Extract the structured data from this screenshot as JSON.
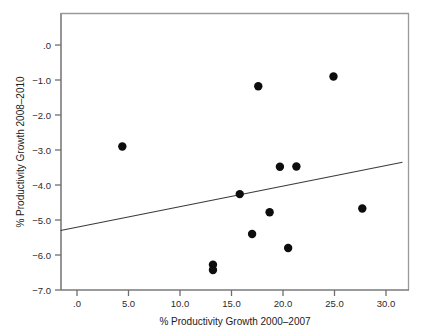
{
  "chart_data": {
    "type": "scatter",
    "title": "",
    "xlabel": "% Productivity Growth 2000–2007",
    "ylabel": "% Productivity Growth 2008–2010",
    "xlim": [
      -1.6,
      31.6
    ],
    "ylim": [
      -7.0,
      0.45
    ],
    "xticks": [
      0,
      5,
      10,
      15,
      20,
      25,
      30
    ],
    "xticklabels": [
      ".0",
      "5.0",
      "10.0",
      "15.0",
      "20.0",
      "25.0",
      "30.0"
    ],
    "yticks": [
      0,
      -1,
      -2,
      -3,
      -4,
      -5,
      -6,
      -7
    ],
    "yticklabels": [
      ".0",
      "−1.0",
      "−2.0",
      "−3.0",
      "−4.0",
      "−5.0",
      "−6.0",
      "−7.0"
    ],
    "grid": false,
    "legend": null,
    "points": [
      {
        "x": 4.4,
        "y": -2.9
      },
      {
        "x": 13.2,
        "y": -6.28
      },
      {
        "x": 13.2,
        "y": -6.43
      },
      {
        "x": 15.8,
        "y": -4.26
      },
      {
        "x": 17.0,
        "y": -5.4
      },
      {
        "x": 17.6,
        "y": -1.18
      },
      {
        "x": 18.7,
        "y": -4.78
      },
      {
        "x": 19.7,
        "y": -3.48
      },
      {
        "x": 20.5,
        "y": -5.8
      },
      {
        "x": 21.3,
        "y": -3.47
      },
      {
        "x": 24.9,
        "y": -0.9
      },
      {
        "x": 27.7,
        "y": -4.67
      }
    ],
    "fit_line": {
      "type": "linear",
      "x_start": -1.6,
      "y_start": -5.3,
      "x_end": 31.6,
      "y_end": -3.35
    },
    "marker_size_px": 4.2,
    "point_color": "#0d0d0d",
    "line_color": "#3a3a3a",
    "frame_color": "#9a9a9a",
    "background": "#ffffff"
  }
}
